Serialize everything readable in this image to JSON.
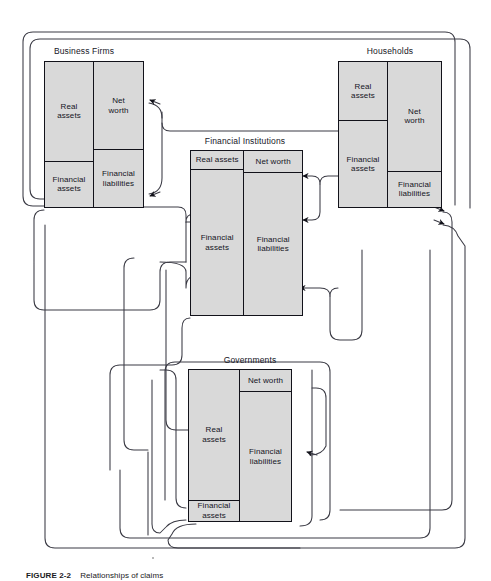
{
  "figure": {
    "caption_label": "FIGURE 2-2",
    "caption_text": "Relationships of claims",
    "background_color": "#ffffff",
    "box_fill_color": "#d9d9d9",
    "line_color": "#12121a"
  },
  "sectors": [
    {
      "id": "business-firms",
      "title": "Business Firms",
      "assets": [
        {
          "label": "Real assets",
          "lines": [
            "Real",
            "assets"
          ]
        },
        {
          "label": "Financial assets",
          "lines": [
            "Financial",
            "assets"
          ]
        }
      ],
      "liabilities": [
        {
          "label": "Net worth",
          "lines": [
            "Net",
            "worth"
          ]
        },
        {
          "label": "Financial liabilities",
          "lines": [
            "Financial",
            "liabilities"
          ]
        }
      ]
    },
    {
      "id": "households",
      "title": "Households",
      "assets": [
        {
          "label": "Real assets",
          "lines": [
            "Real",
            "assets"
          ]
        },
        {
          "label": "Financial assets",
          "lines": [
            "Financial",
            "assets"
          ]
        }
      ],
      "liabilities": [
        {
          "label": "Net worth",
          "lines": [
            "Net",
            "worth"
          ]
        },
        {
          "label": "Financial liabilities",
          "lines": [
            "Financial",
            "liabilities"
          ]
        }
      ]
    },
    {
      "id": "financial-institutions",
      "title": "Financial Institutions",
      "assets": [
        {
          "label": "Real assets",
          "lines": [
            "Real assets"
          ]
        },
        {
          "label": "Financial assets",
          "lines": [
            "Financial",
            "assets"
          ]
        }
      ],
      "liabilities": [
        {
          "label": "Net worth",
          "lines": [
            "Net worth"
          ]
        },
        {
          "label": "Financial liabilities",
          "lines": [
            "Financial",
            "liabilities"
          ]
        }
      ]
    },
    {
      "id": "governments",
      "title": "Governments",
      "assets": [
        {
          "label": "Real assets",
          "lines": [
            "Real",
            "assets"
          ]
        },
        {
          "label": "Financial assets",
          "lines": [
            "Financial",
            "assets"
          ]
        }
      ],
      "liabilities": [
        {
          "label": "Net worth",
          "lines": [
            "Net worth"
          ]
        },
        {
          "label": "Financial liabilities",
          "lines": [
            "Financial",
            "liabilities"
          ]
        }
      ]
    }
  ]
}
